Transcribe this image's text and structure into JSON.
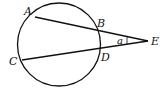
{
  "diagram": {
    "points": {
      "A": {
        "label": "A"
      },
      "B": {
        "label": "B"
      },
      "C": {
        "label": "C"
      },
      "D": {
        "label": "D"
      },
      "E": {
        "label": "E"
      }
    },
    "angle_label": "a",
    "segments": [
      "AE",
      "CE"
    ],
    "stroke_color": "#111111"
  }
}
